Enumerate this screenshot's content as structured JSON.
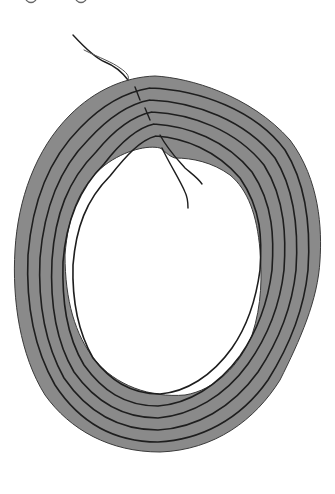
{
  "figure": {
    "colors": {
      "background": "#ffffff",
      "fill": "#8a8a8a",
      "strand": "#1e1e1e",
      "outline": "#3a3a3a"
    },
    "strand_count": 6,
    "top_marks": [
      "o",
      "o"
    ]
  }
}
